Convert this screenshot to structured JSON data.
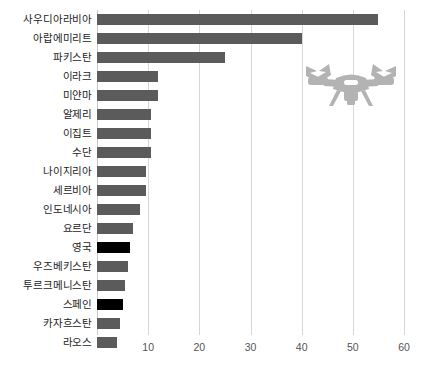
{
  "chart_data": {
    "type": "bar",
    "orientation": "horizontal",
    "title": "",
    "subtitle": "",
    "xlabel": "",
    "ylabel": "",
    "xlim": [
      0,
      60
    ],
    "ylim": null,
    "grid": true,
    "grid_axis": "x",
    "legend": null,
    "legend_position": "none",
    "xticks": [
      10,
      20,
      30,
      40,
      50,
      60
    ],
    "xtick_labels": [
      "10",
      "20",
      "30",
      "40",
      "50",
      "60"
    ],
    "categories": [
      "사우디아라비아",
      "아랍에미리트",
      "파키스탄",
      "이라크",
      "미얀마",
      "알제리",
      "이집트",
      "수단",
      "나이지리아",
      "세르비아",
      "인도네시아",
      "요르단",
      "영국",
      "우즈베키스탄",
      "투르크메니스탄",
      "스페인",
      "카자흐스탄",
      "라오스"
    ],
    "values": [
      55,
      40,
      25,
      12,
      12,
      10.5,
      10.5,
      10.5,
      9.5,
      9.5,
      8.5,
      7,
      6.5,
      6,
      5.5,
      5,
      4.5,
      4
    ],
    "bar_colors": [
      "#5b5b5b",
      "#5b5b5b",
      "#5b5b5b",
      "#5b5b5b",
      "#5b5b5b",
      "#5b5b5b",
      "#5b5b5b",
      "#5b5b5b",
      "#5b5b5b",
      "#5b5b5b",
      "#5b5b5b",
      "#5b5b5b",
      "#000000",
      "#5b5b5b",
      "#5b5b5b",
      "#000000",
      "#5b5b5b",
      "#5b5b5b"
    ],
    "highlighted": [
      "영국",
      "스페인"
    ],
    "colors": {
      "bar_default": "#5b5b5b",
      "bar_highlight": "#000000",
      "gridline": "#d7d7d7",
      "axis": "#c9c9c9",
      "label_text": "#1c1c1c",
      "tick_text": "#555555",
      "icon": "#b3b3b3",
      "background": "#ffffff"
    }
  },
  "icons": {
    "drone": "drone-icon"
  }
}
